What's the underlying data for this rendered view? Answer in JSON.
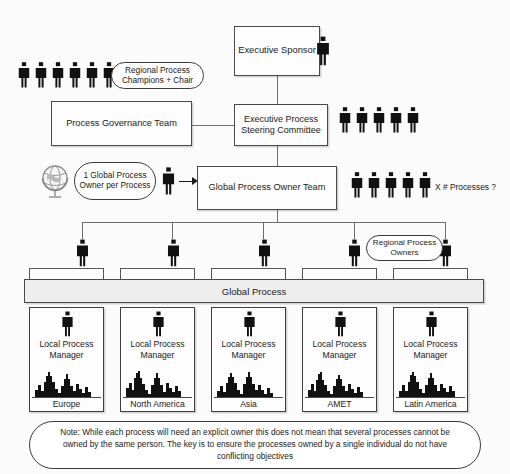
{
  "diagram": {
    "title_nodes": {
      "executive_sponsor": "Executive Sponsor",
      "process_governance_team": "Process Governance Team",
      "executive_process_steering_committee": "Executive Process Steering Committee",
      "global_process_owner_team": "Global Process Owner Team",
      "global_process_bar": "Global Process"
    },
    "annotations": {
      "regional_process_champions": "Regional Process Champions + Chair",
      "one_global_process_owner": "1 Global Process Owner per Process",
      "processes_question": "X # Processes ?",
      "regional_process_owners": "Regional Process Owners"
    },
    "icons": {
      "person": "person-icon",
      "globe": "globe-icon",
      "skyline": "city-skyline-icon",
      "arrow": "arrow-right-icon"
    },
    "people_counts": {
      "executive_sponsor": 1,
      "regional_process_champions": 6,
      "steering_committee": 5,
      "global_process_owner_single": 1,
      "global_process_owner_team": 5,
      "regional_owners_on_bar": 5
    },
    "regions": [
      {
        "role": "Local Process Manager",
        "name": "Europe"
      },
      {
        "role": "Local Process Manager",
        "name": "North America"
      },
      {
        "role": "Local Process Manager",
        "name": "Asia"
      },
      {
        "role": "Local Process Manager",
        "name": "AMET"
      },
      {
        "role": "Local Process Manager",
        "name": "Latin America"
      }
    ],
    "note": "Note: While each process will need an explicit owner this does not mean that several processes cannot be owned by the same person. The key is to ensure the processes owned by a single individual do not have conflicting objectives",
    "colors": {
      "figure_fill": "#111111",
      "box_border": "#4a4a4a",
      "bar_fill": "#eeeeee",
      "background": "#fbfbfb",
      "connector": "#6d6d6d"
    }
  }
}
